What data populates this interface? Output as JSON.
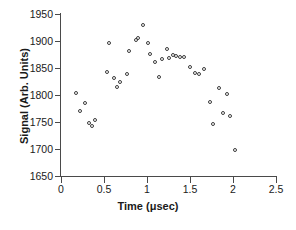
{
  "chart_data": {
    "type": "scatter",
    "title": "",
    "xlabel": "Time (μsec)",
    "ylabel": "Signal (Arb. Units)",
    "xlim": [
      0,
      2.5
    ],
    "ylim": [
      1650,
      1950
    ],
    "xticks": [
      0,
      0.5,
      1,
      1.5,
      2,
      2.5
    ],
    "xticklabels": [
      "0",
      "0.5",
      "1",
      "1.5",
      "2",
      "2.5"
    ],
    "yticks": [
      1650,
      1700,
      1750,
      1800,
      1850,
      1900,
      1950
    ],
    "yticklabels": [
      "1650",
      "1700",
      "1750",
      "1800",
      "1850",
      "1900",
      "1950"
    ],
    "grid": false,
    "legend": null,
    "marker": "open-circle",
    "marker_color": "#3c3c3c",
    "points": [
      {
        "x": 0.17,
        "y": 1803
      },
      {
        "x": 0.22,
        "y": 1771
      },
      {
        "x": 0.28,
        "y": 1786
      },
      {
        "x": 0.32,
        "y": 1749
      },
      {
        "x": 0.36,
        "y": 1743
      },
      {
        "x": 0.4,
        "y": 1753
      },
      {
        "x": 0.53,
        "y": 1843
      },
      {
        "x": 0.56,
        "y": 1896
      },
      {
        "x": 0.62,
        "y": 1832
      },
      {
        "x": 0.65,
        "y": 1814
      },
      {
        "x": 0.69,
        "y": 1824
      },
      {
        "x": 0.77,
        "y": 1839
      },
      {
        "x": 0.79,
        "y": 1882
      },
      {
        "x": 0.87,
        "y": 1901
      },
      {
        "x": 0.9,
        "y": 1905
      },
      {
        "x": 0.95,
        "y": 1930
      },
      {
        "x": 1.01,
        "y": 1896
      },
      {
        "x": 1.04,
        "y": 1876
      },
      {
        "x": 1.09,
        "y": 1861
      },
      {
        "x": 1.14,
        "y": 1834
      },
      {
        "x": 1.18,
        "y": 1866
      },
      {
        "x": 1.23,
        "y": 1885
      },
      {
        "x": 1.26,
        "y": 1869
      },
      {
        "x": 1.3,
        "y": 1875
      },
      {
        "x": 1.34,
        "y": 1872
      },
      {
        "x": 1.38,
        "y": 1870
      },
      {
        "x": 1.43,
        "y": 1870
      },
      {
        "x": 1.5,
        "y": 1852
      },
      {
        "x": 1.56,
        "y": 1840
      },
      {
        "x": 1.61,
        "y": 1839
      },
      {
        "x": 1.66,
        "y": 1849
      },
      {
        "x": 1.73,
        "y": 1787
      },
      {
        "x": 1.77,
        "y": 1747
      },
      {
        "x": 1.84,
        "y": 1813
      },
      {
        "x": 1.88,
        "y": 1766
      },
      {
        "x": 1.93,
        "y": 1802
      },
      {
        "x": 1.96,
        "y": 1761
      },
      {
        "x": 2.02,
        "y": 1698
      }
    ]
  }
}
